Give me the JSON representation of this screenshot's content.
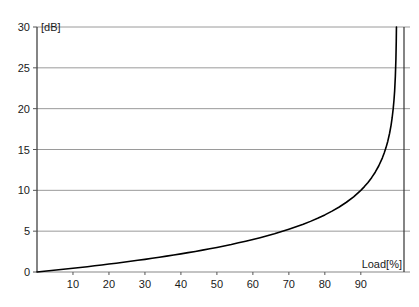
{
  "chart_data": {
    "type": "line",
    "title": "",
    "subtitle": "",
    "xlabel": "Load[%]",
    "ylabel": "[dB]",
    "xlim": [
      0,
      102
    ],
    "ylim": [
      0,
      30
    ],
    "grid": "horizontal",
    "legend": "none",
    "x_ticks": [
      10,
      20,
      30,
      40,
      50,
      60,
      70,
      80,
      90
    ],
    "x_tick_labels": [
      "10",
      "20",
      "30",
      "40",
      "50",
      "60",
      "70",
      "80",
      "90"
    ],
    "y_ticks": [
      0,
      5,
      10,
      15,
      20,
      25,
      30
    ],
    "y_tick_labels": [
      "0",
      "5",
      "10",
      "15",
      "20",
      "25",
      "30"
    ],
    "series": [
      {
        "name": "noise rise",
        "color": "#000000",
        "x": [
          0,
          2,
          4,
          6,
          8,
          10,
          12,
          14,
          16,
          18,
          20,
          22,
          24,
          26,
          28,
          30,
          32,
          34,
          36,
          38,
          40,
          42,
          44,
          46,
          48,
          50,
          52,
          54,
          56,
          58,
          60,
          62,
          64,
          66,
          68,
          70,
          72,
          74,
          76,
          78,
          80,
          82,
          84,
          86,
          88,
          90,
          91,
          92,
          93,
          94,
          95,
          96,
          96.5,
          97,
          97.5,
          98,
          98.4,
          98.7,
          99,
          99.2,
          99.4,
          99.6,
          99.75,
          99.85,
          99.9
        ],
        "y": [
          0,
          0.09,
          0.18,
          0.27,
          0.36,
          0.46,
          0.55,
          0.65,
          0.76,
          0.86,
          0.97,
          1.08,
          1.19,
          1.31,
          1.43,
          1.55,
          1.68,
          1.8,
          1.94,
          2.08,
          2.22,
          2.37,
          2.52,
          2.68,
          2.84,
          3.01,
          3.19,
          3.37,
          3.57,
          3.77,
          3.98,
          4.2,
          4.44,
          4.68,
          4.95,
          5.23,
          5.53,
          5.85,
          6.2,
          6.58,
          6.99,
          7.45,
          7.96,
          8.54,
          9.21,
          10.0,
          10.46,
          10.97,
          11.55,
          12.22,
          13.01,
          13.98,
          14.56,
          15.23,
          16.02,
          16.99,
          17.96,
          18.86,
          20.0,
          20.97,
          22.18,
          23.98,
          26.02,
          28.24,
          30.0
        ]
      }
    ],
    "annotations": []
  },
  "axes": {
    "y_unit_label": "[dB]",
    "x_axis_title": "Load[%]"
  }
}
